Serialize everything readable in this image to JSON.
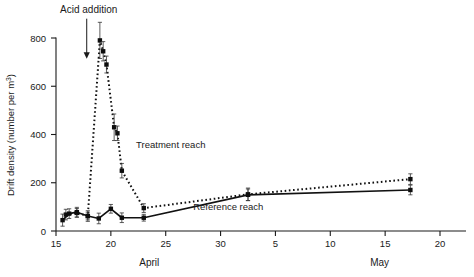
{
  "chart_data": {
    "type": "line",
    "title": "",
    "xlabel": "",
    "ylabel": "Drift density (number per m³)",
    "ylabel_main": "Drift density (number per m",
    "ylabel_sup": "3",
    "ylabel_close": ")",
    "ylim": [
      0,
      880
    ],
    "yticks": [
      0,
      200,
      400,
      600,
      800
    ],
    "ytick_labels": [
      "0",
      "200",
      "400",
      "600",
      "800"
    ],
    "xlim_days": [
      15,
      51
    ],
    "xticks_days": [
      15,
      20,
      25,
      30,
      35,
      40,
      45,
      50
    ],
    "xtick_labels": [
      "15",
      "20",
      "25",
      "30",
      "5",
      "10",
      "15",
      "20"
    ],
    "month_labels": [
      {
        "text": "April",
        "day": 23.5
      },
      {
        "text": "May",
        "day": 44.5
      }
    ],
    "grid": false,
    "legend": "inline-annotations",
    "annotations": [
      {
        "name": "acid-addition",
        "text": "Acid addition",
        "day": 17.8,
        "arrow_from": 880,
        "arrow_to": 720
      }
    ],
    "series": [
      {
        "name": "Treatment reach",
        "label": "Treatment reach",
        "style": "dotted",
        "label_day": 22.3,
        "label_value": 345,
        "points": [
          {
            "day": 15.9,
            "value": 68,
            "err": 22
          },
          {
            "day": 16.9,
            "value": 75,
            "err": 18
          },
          {
            "day": 17.9,
            "value": 62,
            "err": 16
          },
          {
            "day": 19.0,
            "value": 790,
            "err": 75
          },
          {
            "day": 19.3,
            "value": 745,
            "err": 40
          },
          {
            "day": 19.6,
            "value": 690,
            "err": 35
          },
          {
            "day": 20.3,
            "value": 430,
            "err": 55
          },
          {
            "day": 20.6,
            "value": 405,
            "err": 30
          },
          {
            "day": 21.0,
            "value": 250,
            "err": 30
          },
          {
            "day": 23.0,
            "value": 95,
            "err": 18
          },
          {
            "day": 32.5,
            "value": 152,
            "err": 26
          },
          {
            "day": 47.3,
            "value": 215,
            "err": 22
          }
        ]
      },
      {
        "name": "Reference reach",
        "label": "Reference reach",
        "style": "solid",
        "label_day": 27.5,
        "label_value": 88,
        "points": [
          {
            "day": 15.6,
            "value": 45,
            "err": 25
          },
          {
            "day": 16.2,
            "value": 72,
            "err": 20
          },
          {
            "day": 16.9,
            "value": 78,
            "err": 20
          },
          {
            "day": 17.9,
            "value": 62,
            "err": 22
          },
          {
            "day": 18.9,
            "value": 52,
            "err": 22
          },
          {
            "day": 20.0,
            "value": 92,
            "err": 18
          },
          {
            "day": 21.0,
            "value": 55,
            "err": 20
          },
          {
            "day": 23.0,
            "value": 55,
            "err": 14
          },
          {
            "day": 32.5,
            "value": 150,
            "err": 24
          },
          {
            "day": 47.3,
            "value": 170,
            "err": 20
          }
        ]
      }
    ]
  }
}
